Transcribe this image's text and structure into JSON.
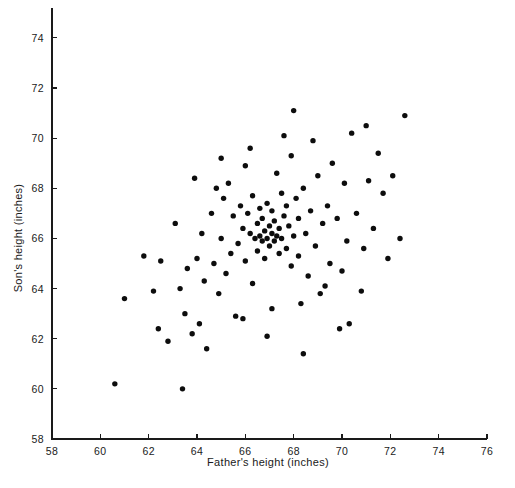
{
  "chart_data": {
    "type": "scatter",
    "title": "",
    "xlabel": "Father's height (inches)",
    "ylabel": "Son's height (inches)",
    "xlim": [
      58,
      76
    ],
    "ylim": [
      58,
      75.2
    ],
    "xticks": [
      58,
      60,
      62,
      64,
      66,
      68,
      70,
      72,
      74,
      76
    ],
    "xtick_labels": [
      "58",
      "60",
      "62",
      "64",
      "66",
      "68",
      "70",
      "72",
      "74",
      "76"
    ],
    "yticks": [
      58,
      60,
      62,
      64,
      66,
      68,
      70,
      72,
      74
    ],
    "ytick_labels": [
      "58",
      "60",
      "62",
      "64",
      "66",
      "68",
      "70",
      "72",
      "74"
    ],
    "grid": false,
    "legend": false,
    "marker": "filled-circle",
    "marker_color": "#0d0d0d",
    "marker_size_px": 5.4,
    "n_points": 112,
    "points": [
      [
        60.6,
        60.2
      ],
      [
        61.0,
        63.6
      ],
      [
        61.8,
        65.3
      ],
      [
        62.2,
        63.9
      ],
      [
        62.4,
        62.4
      ],
      [
        62.5,
        65.1
      ],
      [
        62.8,
        61.9
      ],
      [
        63.1,
        66.6
      ],
      [
        63.3,
        64.0
      ],
      [
        63.4,
        60.0
      ],
      [
        63.5,
        63.0
      ],
      [
        63.6,
        64.8
      ],
      [
        63.9,
        68.4
      ],
      [
        64.0,
        65.2
      ],
      [
        64.2,
        66.2
      ],
      [
        64.3,
        64.3
      ],
      [
        64.4,
        61.6
      ],
      [
        64.6,
        67.0
      ],
      [
        64.7,
        65.0
      ],
      [
        64.9,
        63.8
      ],
      [
        65.0,
        66.0
      ],
      [
        65.1,
        67.6
      ],
      [
        65.2,
        64.6
      ],
      [
        65.3,
        68.2
      ],
      [
        65.4,
        65.4
      ],
      [
        65.5,
        66.9
      ],
      [
        65.6,
        62.9
      ],
      [
        65.7,
        65.8
      ],
      [
        65.8,
        67.3
      ],
      [
        65.9,
        66.4
      ],
      [
        66.0,
        68.9
      ],
      [
        66.0,
        65.1
      ],
      [
        66.1,
        67.0
      ],
      [
        66.2,
        66.2
      ],
      [
        66.3,
        64.2
      ],
      [
        66.3,
        67.7
      ],
      [
        66.4,
        66.0
      ],
      [
        66.5,
        66.6
      ],
      [
        66.5,
        65.5
      ],
      [
        66.6,
        67.2
      ],
      [
        66.6,
        66.1
      ],
      [
        66.7,
        65.9
      ],
      [
        66.7,
        66.8
      ],
      [
        66.8,
        66.3
      ],
      [
        66.8,
        65.2
      ],
      [
        66.9,
        67.4
      ],
      [
        66.9,
        66.0
      ],
      [
        67.0,
        66.5
      ],
      [
        67.0,
        65.7
      ],
      [
        67.1,
        66.2
      ],
      [
        67.1,
        67.1
      ],
      [
        67.2,
        65.9
      ],
      [
        67.2,
        66.7
      ],
      [
        67.3,
        66.1
      ],
      [
        67.3,
        68.6
      ],
      [
        67.4,
        65.4
      ],
      [
        67.4,
        66.4
      ],
      [
        67.5,
        67.8
      ],
      [
        67.5,
        66.0
      ],
      [
        67.6,
        66.9
      ],
      [
        67.7,
        65.6
      ],
      [
        67.7,
        67.3
      ],
      [
        67.8,
        66.5
      ],
      [
        67.9,
        64.9
      ],
      [
        67.9,
        69.3
      ],
      [
        68.0,
        66.1
      ],
      [
        68.0,
        71.1
      ],
      [
        68.1,
        67.6
      ],
      [
        68.2,
        65.3
      ],
      [
        68.2,
        66.8
      ],
      [
        68.3,
        63.4
      ],
      [
        68.4,
        68.0
      ],
      [
        68.4,
        61.4
      ],
      [
        68.5,
        66.2
      ],
      [
        68.6,
        64.5
      ],
      [
        68.7,
        67.1
      ],
      [
        68.8,
        69.9
      ],
      [
        68.9,
        65.7
      ],
      [
        69.0,
        68.5
      ],
      [
        69.1,
        63.8
      ],
      [
        69.2,
        66.6
      ],
      [
        69.3,
        64.1
      ],
      [
        69.4,
        67.3
      ],
      [
        69.5,
        65.0
      ],
      [
        69.6,
        69.0
      ],
      [
        69.8,
        66.8
      ],
      [
        70.0,
        64.7
      ],
      [
        70.1,
        68.2
      ],
      [
        70.2,
        65.9
      ],
      [
        70.4,
        70.2
      ],
      [
        70.6,
        67.0
      ],
      [
        70.8,
        63.9
      ],
      [
        70.9,
        65.6
      ],
      [
        71.0,
        70.5
      ],
      [
        71.1,
        68.3
      ],
      [
        71.3,
        66.4
      ],
      [
        71.5,
        69.4
      ],
      [
        71.7,
        67.8
      ],
      [
        71.9,
        65.2
      ],
      [
        72.1,
        68.5
      ],
      [
        72.4,
        66.0
      ],
      [
        72.6,
        70.9
      ],
      [
        63.8,
        62.2
      ],
      [
        64.1,
        62.6
      ],
      [
        65.9,
        62.8
      ],
      [
        66.9,
        62.1
      ],
      [
        67.1,
        63.2
      ],
      [
        70.3,
        62.6
      ],
      [
        65.0,
        69.2
      ],
      [
        66.2,
        69.6
      ],
      [
        67.6,
        70.1
      ],
      [
        64.8,
        68.0
      ],
      [
        69.9,
        62.4
      ]
    ]
  }
}
